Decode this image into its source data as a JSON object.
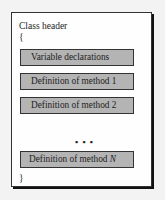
{
  "diagram": {
    "header": "Class header",
    "open_brace": "{",
    "close_brace": "}",
    "sections": [
      {
        "label": "Variable declarations"
      },
      {
        "label": "Definition of method 1"
      },
      {
        "label": "Definition of method 2"
      },
      {
        "label_prefix": "Definition of method ",
        "label_var": "N"
      }
    ],
    "ellipsis": "• • •",
    "colors": {
      "box_fill": "#b4b4b4",
      "border": "#333333",
      "background": "#fefefe"
    }
  }
}
